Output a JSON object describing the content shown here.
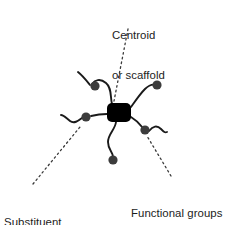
{
  "figure": {
    "type": "molecular-schematic-diagram",
    "background_color": "#ffffff",
    "width": 227,
    "height": 225
  },
  "labels": {
    "centroid": {
      "name": "centroid-label",
      "line1": "Centroid",
      "line2": "or scaffold",
      "text_color": "#1c1c1c",
      "anchor_x": 112,
      "anchor_y": 3
    },
    "substituent": {
      "name": "substituent-label",
      "line1": "Substituent",
      "line2": "‘arms’",
      "text_color": "#1c1c1c",
      "anchor_x": 4,
      "anchor_y": 190
    },
    "functional": {
      "name": "functional-groups-label",
      "line1": "Functional groups",
      "line2": "",
      "text_color": "#1c1c1c",
      "anchor_x": 131,
      "anchor_y": 181
    }
  },
  "graphic": {
    "scaffold": {
      "name": "centroid-scaffold",
      "shape": "rounded-rectangle",
      "fill": "#000000",
      "x": 107,
      "y": 103,
      "width": 24,
      "height": 19,
      "corner_radius": 5
    },
    "arm_color": "#1a1a1a",
    "arm_stroke_width": 1.9,
    "dot_color": "#3c3c3c",
    "dot_radius": 4.6,
    "leader_color": "#3a3a3a",
    "leader_stroke_width": 1.3,
    "leader_dash": "1.6 3.2",
    "arms": [
      {
        "name": "arm-upper-left",
        "path": "M 112 104 C 110 96 112 88 106 83 C 100 78 95 80 92 84",
        "terminal_dot": {
          "cx": 95,
          "cy": 86
        },
        "tail": "M 90 85 C 86 80 83 76 78 72"
      },
      {
        "name": "arm-upper-right",
        "path": "M 131 107 C 136 100 140 94 145 89 C 149 85 153 84 156 85",
        "terminal_dot": {
          "cx": 157,
          "cy": 85
        },
        "tail": ""
      },
      {
        "name": "arm-right-lower",
        "path": "M 131 117 C 136 120 140 124 143 128",
        "terminal_dot": {
          "cx": 145,
          "cy": 130
        },
        "tail": "M 149 131 C 153 126 157 125 161 129 C 164 132 165 133 167 132"
      },
      {
        "name": "arm-bottom",
        "path": "M 116 122 C 115 130 108 134 108 142 C 108 150 113 152 113 157",
        "terminal_dot": {
          "cx": 113,
          "cy": 160
        },
        "tail": ""
      },
      {
        "name": "arm-left",
        "path": "M 107 114 C 100 114 95 115 91 116",
        "terminal_dot": {
          "cx": 86,
          "cy": 117
        },
        "tail": "M 82 118 C 78 121 74 124 70 121 C 66 118 64 115 61 115"
      }
    ],
    "leaders": [
      {
        "name": "leader-centroid",
        "x1": 128,
        "y1": 29,
        "x2": 114,
        "y2": 101
      },
      {
        "name": "leader-substituent",
        "x1": 33,
        "y1": 184,
        "x2": 80,
        "y2": 127
      },
      {
        "name": "leader-functional",
        "x1": 171,
        "y1": 176,
        "x2": 147,
        "y2": 136
      }
    ]
  }
}
